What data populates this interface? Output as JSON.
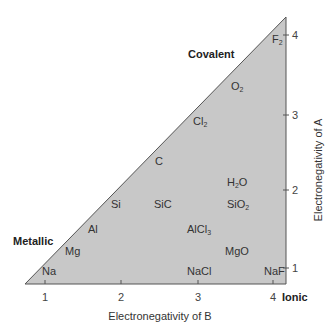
{
  "diagram": {
    "type": "van Arkel-Ketelaar triangle",
    "fill_color": "#c8c8c8",
    "edge_color": "#555555",
    "regions": {
      "covalent": "Covalent",
      "metallic": "Metallic",
      "ionic": "Ionic"
    },
    "x_axis": {
      "label": "Electronegativity of B",
      "ticks": [
        "1",
        "2",
        "3",
        "4"
      ]
    },
    "y_axis": {
      "label": "Electronegativity of A",
      "ticks": [
        "1",
        "2",
        "3",
        "4"
      ]
    },
    "compounds": [
      {
        "name": "F",
        "sub": "2"
      },
      {
        "name": "O",
        "sub": "2"
      },
      {
        "name": "Cl",
        "sub": "2"
      },
      {
        "name": "C",
        "sub": ""
      },
      {
        "name": "H",
        "sub": "2",
        "suffix": "O"
      },
      {
        "name": "Si",
        "sub": ""
      },
      {
        "name": "SiC",
        "sub": ""
      },
      {
        "name": "SiO",
        "sub": "2"
      },
      {
        "name": "Al",
        "sub": ""
      },
      {
        "name": "AlCl",
        "sub": "3"
      },
      {
        "name": "Mg",
        "sub": ""
      },
      {
        "name": "MgO",
        "sub": ""
      },
      {
        "name": "Na",
        "sub": ""
      },
      {
        "name": "NaCl",
        "sub": ""
      },
      {
        "name": "NaF",
        "sub": ""
      }
    ]
  }
}
